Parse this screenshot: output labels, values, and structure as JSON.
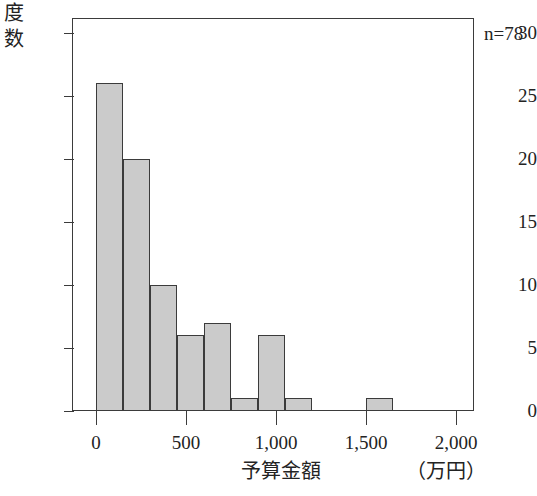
{
  "chart_data": {
    "type": "bar",
    "title": "",
    "subtitle": "",
    "xlabel": "予算金額",
    "xunit": "（万円）",
    "ylabel": "度数",
    "ylabel_chars": [
      "度",
      "数"
    ],
    "annotation": "n=78",
    "grid": false,
    "legend": "none",
    "xlim": [
      0,
      2000
    ],
    "ylim": [
      0,
      31
    ],
    "bin_width": 150,
    "xticks": [
      0,
      500,
      1000,
      1500,
      2000
    ],
    "xtick_labels": [
      "0",
      "500",
      "1,000",
      "1,500",
      "2,000"
    ],
    "yticks": [
      0,
      5,
      10,
      15,
      20,
      25,
      30
    ],
    "ytick_labels": [
      "0",
      "5",
      "10",
      "15",
      "20",
      "25",
      "30"
    ],
    "bin_starts": [
      0,
      150,
      300,
      450,
      600,
      750,
      900,
      1050,
      1200,
      1350,
      1500,
      1650,
      1800
    ],
    "values": [
      26,
      20,
      10,
      6,
      7,
      1,
      6,
      1,
      0,
      0,
      1,
      0,
      0
    ],
    "bars": [
      {
        "bin_start": 0,
        "bin_end": 150,
        "value": 26
      },
      {
        "bin_start": 150,
        "bin_end": 300,
        "value": 20
      },
      {
        "bin_start": 300,
        "bin_end": 450,
        "value": 10
      },
      {
        "bin_start": 450,
        "bin_end": 600,
        "value": 6
      },
      {
        "bin_start": 600,
        "bin_end": 750,
        "value": 7
      },
      {
        "bin_start": 750,
        "bin_end": 900,
        "value": 1
      },
      {
        "bin_start": 900,
        "bin_end": 1050,
        "value": 6
      },
      {
        "bin_start": 1050,
        "bin_end": 1200,
        "value": 1
      },
      {
        "bin_start": 1200,
        "bin_end": 1350,
        "value": 0
      },
      {
        "bin_start": 1350,
        "bin_end": 1500,
        "value": 0
      },
      {
        "bin_start": 1500,
        "bin_end": 1650,
        "value": 1
      },
      {
        "bin_start": 1650,
        "bin_end": 1800,
        "value": 0
      },
      {
        "bin_start": 1800,
        "bin_end": 1950,
        "value": 0
      }
    ],
    "colors": {
      "bar_fill": "#cbcbcb",
      "bar_stroke": "#3b3b3b",
      "axis": "#3b3b3b",
      "text": "#232323",
      "background": "#ffffff"
    }
  }
}
